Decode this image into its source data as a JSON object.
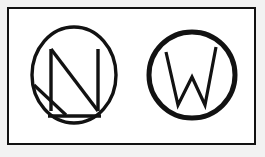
{
  "canvas": {
    "width": 265,
    "height": 157,
    "background_color": "#f2f2f2"
  },
  "card": {
    "background_color": "#ffffff",
    "border_color": "#121212",
    "border_width": 2
  },
  "logos": [
    {
      "id": "monogram-n",
      "letter": "N",
      "name": "letter-n-circle-monogram",
      "description": "Capital letter N with an underline inside a thin circle, with an extra diagonal stroke running to the lower-left of the circle",
      "stroke_color": "#121212",
      "circle_stroke_width": 3,
      "letter_stroke_width": 3,
      "circle": {
        "cx": 49,
        "cy": 50,
        "r": 42
      },
      "has_underline": true,
      "has_extra_diagonal": true
    },
    {
      "id": "monogram-w",
      "letter": "W",
      "name": "letter-w-circle-monogram",
      "description": "Capital letter W inside a thick circle",
      "stroke_color": "#121212",
      "circle_stroke_width": 5,
      "letter_stroke_width": 3,
      "circle": {
        "cx": 47,
        "cy": 50,
        "r": 42
      },
      "has_underline": false,
      "has_extra_diagonal": false
    }
  ],
  "alt_text": {
    "scene": "Two black circular monogram logos on a white bordered card",
    "left_logo": "N monogram in circle",
    "right_logo": "W monogram in circle"
  }
}
